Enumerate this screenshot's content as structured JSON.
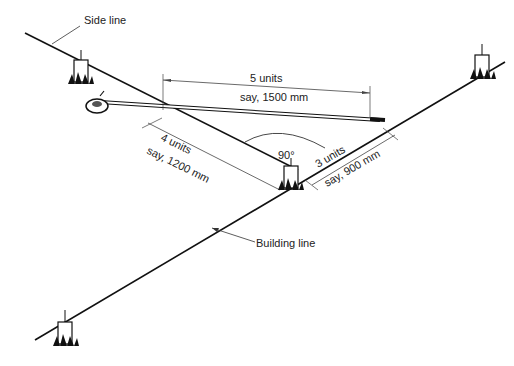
{
  "diagram": {
    "labels": {
      "side_line": "Side line",
      "building_line": "Building line",
      "five_units": "5 units",
      "five_mm": "say, 1500 mm",
      "four_units": "4 units",
      "four_mm": "say, 1200 mm",
      "three_units": "3 units",
      "three_mm": "say, 900 mm",
      "angle": "90°"
    },
    "colors": {
      "line": "#111111",
      "dim": "#444444",
      "background": "#ffffff"
    }
  }
}
